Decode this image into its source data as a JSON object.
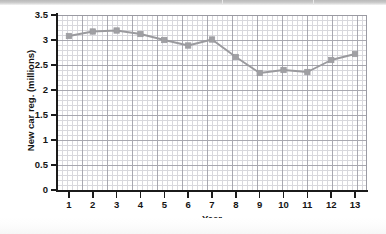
{
  "chart_data": {
    "type": "line",
    "title": "",
    "subtitle": "",
    "xlabel": "Year",
    "ylabel": "New car reg. (millions)",
    "x": [
      1,
      2,
      3,
      4,
      5,
      6,
      7,
      8,
      9,
      10,
      11,
      12,
      13
    ],
    "categories": [
      "1",
      "2",
      "3",
      "4",
      "5",
      "6",
      "7",
      "8",
      "9",
      "10",
      "11",
      "12",
      "13"
    ],
    "values": [
      3.08,
      3.17,
      3.19,
      3.12,
      3.0,
      2.89,
      3.01,
      2.66,
      2.34,
      2.4,
      2.36,
      2.6,
      2.72
    ],
    "series": [
      {
        "name": "New car registrations",
        "values": [
          3.08,
          3.17,
          3.19,
          3.12,
          3.0,
          2.89,
          3.01,
          2.66,
          2.34,
          2.4,
          2.36,
          2.6,
          2.72
        ]
      }
    ],
    "xlim": [
      0.5,
      13.5
    ],
    "ylim": [
      0,
      3.5
    ],
    "ytick_labels": [
      "0",
      "0.5",
      "1",
      "1.5",
      "2",
      "2.5",
      "3",
      "3.5"
    ],
    "ytick_values": [
      0,
      0.5,
      1,
      1.5,
      2,
      2.5,
      3,
      3.5
    ],
    "xtick_labels": [
      "1",
      "2",
      "3",
      "4",
      "5",
      "6",
      "7",
      "8",
      "9",
      "10",
      "11",
      "12",
      "13"
    ],
    "grid": true,
    "grid_minor": true,
    "legend": false,
    "legend_position": "none",
    "marker": "square",
    "line_color": "#9a9a9e",
    "marker_color": "#a0a0a4",
    "grid_major_color": "#a8a8b0",
    "grid_minor_color": "#d8d8dd",
    "axis_color": "#1b1b1b",
    "background_color": "#ffffff"
  }
}
